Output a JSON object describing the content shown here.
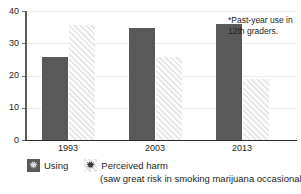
{
  "chart_data": {
    "type": "bar",
    "title": "",
    "subtitle": "",
    "xlabel": "",
    "ylabel": "",
    "ylim": [
      0,
      40
    ],
    "ytick_step": 10,
    "ytick_labels": [
      "0",
      "10",
      "20",
      "30",
      "40"
    ],
    "grid": true,
    "grid_axis": "y",
    "legend_position": "bottom-left",
    "categories": [
      "1993",
      "2003",
      "2013"
    ],
    "series": [
      {
        "name": "Using",
        "color": "#595959",
        "values": [
          25.6,
          34.7,
          36.0
        ]
      },
      {
        "name": "Perceived harm",
        "color": "#e4e4e4",
        "values": [
          35.6,
          25.8,
          18.8
        ]
      }
    ],
    "annotations": [
      {
        "text": "*Past-year use in 12th graders.",
        "position": "top-right"
      }
    ]
  },
  "annotation": {
    "note": "*Past-year use in 12th graders."
  },
  "legend": {
    "entries": [
      {
        "label": "Using",
        "icon": "marijuana-leaf-icon",
        "swatch_color": "#595959"
      },
      {
        "label": "Perceived harm",
        "icon": "marijuana-leaf-icon",
        "swatch_color": "#e4e4e4"
      }
    ],
    "sublabel": "(saw great risk in smoking marijuana occasionally)"
  },
  "axes": {
    "y_ticks": [
      "40",
      "30",
      "20",
      "10",
      "0"
    ],
    "x_ticks": [
      "1993",
      "2003",
      "2013"
    ]
  }
}
